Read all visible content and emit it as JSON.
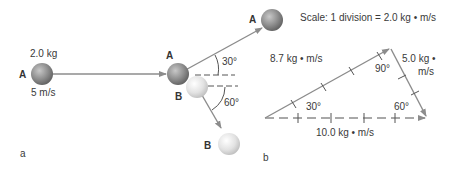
{
  "panel_a": {
    "label": "a",
    "ball_a_before": {
      "name": "A",
      "mass": "2.0 kg",
      "velocity": "5 m/s"
    },
    "ball_a_after": {
      "name": "A"
    },
    "ball_b_before": {
      "name": "B"
    },
    "ball_b_after": {
      "name": "B"
    },
    "angle_a": "30°",
    "angle_b": "60°"
  },
  "panel_b": {
    "label": "b",
    "scale": "Scale: 1 division = 2.0 kg • m/s",
    "vector_a": "8.7 kg • m/s",
    "vector_b_line1": "5.0 kg •",
    "vector_b_line2": "m/s",
    "vector_total": "10.0 kg • m/s",
    "angle_right": "90°",
    "angle_left": "30°",
    "angle_bottom_right": "60°"
  },
  "colors": {
    "ball_a": "#8a8a8a",
    "ball_b": "#dcdcdc",
    "arrow": "#8c8c8c",
    "text": "#3a3a3a"
  }
}
